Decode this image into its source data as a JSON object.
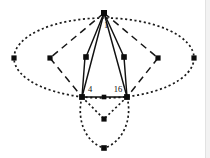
{
  "figure": {
    "background_color": "#ffffff",
    "node_color": "#0c0c0c",
    "edge_color": "#111111",
    "labels": {
      "apex_edge_label": "1",
      "left_base_label": "4",
      "right_base_label": "16"
    },
    "nodes": [
      {
        "id": "apex",
        "name": "apex-node",
        "x": 104,
        "y": 13,
        "size": 6.0
      },
      {
        "id": "ell-left",
        "name": "ellipse-left-node",
        "x": 14,
        "y": 58,
        "size": 5.2
      },
      {
        "id": "ell-right",
        "name": "ellipse-right-node",
        "x": 194,
        "y": 58,
        "size": 5.2
      },
      {
        "id": "mid-l",
        "name": "mid-left-node",
        "x": 50,
        "y": 58,
        "size": 5.2
      },
      {
        "id": "mid-ml",
        "name": "mid-inner-left-node",
        "x": 86,
        "y": 57,
        "size": 5.6
      },
      {
        "id": "mid-mr",
        "name": "mid-inner-right-node",
        "x": 124,
        "y": 57,
        "size": 5.6
      },
      {
        "id": "mid-r",
        "name": "mid-right-node",
        "x": 158,
        "y": 58,
        "size": 5.2
      },
      {
        "id": "base-l",
        "name": "base-left-node",
        "x": 82,
        "y": 97,
        "size": 5.8
      },
      {
        "id": "base-m",
        "name": "base-middle-node",
        "x": 104,
        "y": 97,
        "size": 4.6
      },
      {
        "id": "base-r",
        "name": "base-right-node",
        "x": 127,
        "y": 97,
        "size": 5.8
      },
      {
        "id": "vee",
        "name": "vee-vertex-node",
        "x": 104,
        "y": 119,
        "size": 5.2
      },
      {
        "id": "bottom",
        "name": "bottom-node",
        "x": 104,
        "y": 148,
        "size": 5.6
      }
    ],
    "edges": [
      {
        "name": "edge-apex-to-mid-inner-left",
        "style": "solid",
        "from": "apex",
        "to": "mid-ml"
      },
      {
        "name": "edge-apex-to-mid-inner-right",
        "style": "solid",
        "from": "apex",
        "to": "mid-mr"
      },
      {
        "name": "edge-apex-to-base-left",
        "style": "solid",
        "from": "apex",
        "to": "base-l"
      },
      {
        "name": "edge-apex-to-base-right",
        "style": "solid",
        "from": "apex",
        "to": "base-r"
      },
      {
        "name": "edge-mid-inner-left-vertical",
        "style": "solid",
        "from": "mid-ml",
        "to": "base-l"
      },
      {
        "name": "edge-mid-inner-right-vertical",
        "style": "solid",
        "from": "mid-mr",
        "to": "base-r"
      },
      {
        "name": "edge-base-left-to-middle",
        "style": "solid",
        "from": "base-l",
        "to": "base-m"
      },
      {
        "name": "edge-base-middle-to-right",
        "style": "solid",
        "from": "base-m",
        "to": "base-r"
      },
      {
        "name": "edge-apex-to-mid-left",
        "style": "dashed",
        "from": "apex",
        "to": "mid-l"
      },
      {
        "name": "edge-apex-to-mid-right",
        "style": "dashed",
        "from": "apex",
        "to": "mid-r"
      },
      {
        "name": "edge-mid-left-to-base-left",
        "style": "dashed",
        "from": "mid-l",
        "to": "base-l"
      },
      {
        "name": "edge-mid-right-to-base-right",
        "style": "dashed",
        "from": "mid-r",
        "to": "base-r"
      },
      {
        "name": "edge-base-left-to-vee",
        "style": "dotted",
        "from": "base-l",
        "to": "vee"
      },
      {
        "name": "edge-base-right-to-vee",
        "style": "dotted",
        "from": "base-r",
        "to": "vee"
      }
    ],
    "curves": [
      {
        "name": "ellipse-outer-cycle",
        "style": "dotted",
        "cx": 104,
        "cy": 58,
        "rx": 90,
        "ry": 40
      },
      {
        "name": "lower-lens-curve",
        "style": "dotted",
        "description": "dotted arc from base-left through bottom node to base-right"
      }
    ],
    "label_positions": [
      {
        "name": "apex-edge-label",
        "text_key": "apex_edge_label",
        "x": 106,
        "y": 26
      },
      {
        "name": "left-base-edge-label",
        "text_key": "left_base_label",
        "x": 90,
        "y": 90
      },
      {
        "name": "right-base-edge-label",
        "text_key": "right_base_label",
        "x": 118,
        "y": 90
      }
    ]
  }
}
